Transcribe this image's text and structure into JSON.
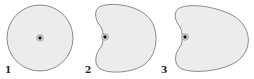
{
  "diagram": {
    "panels": [
      {
        "label": "1",
        "shape": "circle"
      },
      {
        "label": "2",
        "shape": "cardioid"
      },
      {
        "label": "3",
        "shape": "elongated-cardioid"
      }
    ],
    "colors": {
      "fill": "#ececec",
      "stroke": "#8a8a8a",
      "dot": "#111111",
      "dot_halo": "#9a9a9a"
    }
  }
}
